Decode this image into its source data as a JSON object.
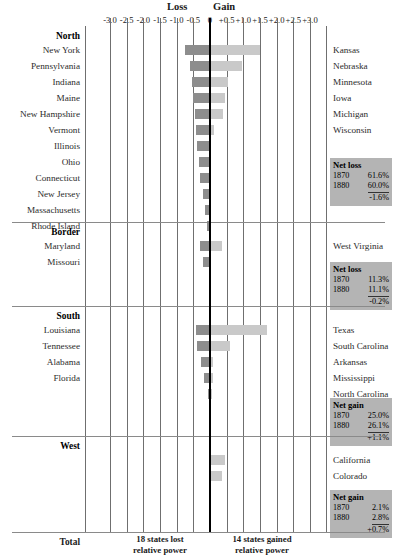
{
  "header": {
    "loss_label": "Loss",
    "gain_label": "Gain",
    "axis_ticks": [
      "-3.0",
      "-2.5",
      "-2.0",
      "-1.5",
      "-1.0",
      "-0.5",
      "0",
      "+0.5",
      "+1.0",
      "+1.5",
      "+2.0",
      "+2.5",
      "+3.0"
    ]
  },
  "total": {
    "label": "Total",
    "left_note": "18 states lost\nrelative power",
    "left_note_line1": "18 states lost",
    "left_note_line2": "relative power",
    "right_note_line1": "14 states gained",
    "right_note_line2": "relative power"
  },
  "colors": {
    "loss_bar": "#8d8d8d",
    "gain_bar": "#c9c9c9",
    "netbox_bg": "#b4b4b4",
    "zero_line": "#000000",
    "gridline": "#6f6f6f"
  },
  "chart_data": {
    "type": "bar",
    "title": "",
    "xlabel": "",
    "ylabel": "",
    "xlim": [
      -3.0,
      3.0
    ],
    "grid": true,
    "orientation": "horizontal-diverging",
    "legend_position": "top",
    "series": [
      {
        "name": "Loss",
        "color": "#8d8d8d"
      },
      {
        "name": "Gain",
        "color": "#c9c9c9"
      }
    ],
    "sections": [
      {
        "name": "North",
        "rows": [
          {
            "left": "New York",
            "right": "Kansas",
            "loss": -0.75,
            "gain": 1.5
          },
          {
            "left": "Pennsylvania",
            "right": "Nebraska",
            "loss": -0.6,
            "gain": 0.95
          },
          {
            "left": "Indiana",
            "right": "Minnesota",
            "loss": -0.55,
            "gain": 0.55
          },
          {
            "left": "Maine",
            "right": "Iowa",
            "loss": -0.5,
            "gain": 0.45
          },
          {
            "left": "New Hampshire",
            "right": "Michigan",
            "loss": -0.45,
            "gain": 0.4
          },
          {
            "left": "Vermont",
            "right": "Wisconsin",
            "loss": -0.42,
            "gain": 0.12
          },
          {
            "left": "Illinois",
            "right": "",
            "loss": -0.38,
            "gain": 0.0
          },
          {
            "left": "Ohio",
            "right": "",
            "loss": -0.34,
            "gain": 0.0
          },
          {
            "left": "Connecticut",
            "right": "",
            "loss": -0.3,
            "gain": 0.0
          },
          {
            "left": "New Jersey",
            "right": "",
            "loss": -0.22,
            "gain": 0.0
          },
          {
            "left": "Massachusetts",
            "right": "",
            "loss": -0.14,
            "gain": 0.0
          },
          {
            "left": "Rhode Island",
            "right": "",
            "loss": -0.1,
            "gain": 0.0
          }
        ],
        "net": {
          "title": "Net loss",
          "y1_label": "1870",
          "y1": "61.6%",
          "y2_label": "1880",
          "y2": "60.0%",
          "delta": "-1.6%"
        }
      },
      {
        "name": "Border",
        "rows": [
          {
            "left": "Maryland",
            "right": "West Virginia",
            "loss": -0.3,
            "gain": 0.36
          },
          {
            "left": "Missouri",
            "right": "",
            "loss": -0.22,
            "gain": 0.0
          }
        ],
        "net": {
          "title": "Net loss",
          "y1_label": "1870",
          "y1": "11.3%",
          "y2_label": "1880",
          "y2": "11.1%",
          "delta": "-0.2%"
        }
      },
      {
        "name": "South",
        "rows": [
          {
            "left": "Louisiana",
            "right": "Texas",
            "loss": -0.42,
            "gain": 1.7
          },
          {
            "left": "Tennessee",
            "right": "South Carolina",
            "loss": -0.4,
            "gain": 0.6
          },
          {
            "left": "Alabama",
            "right": "Arkansas",
            "loss": -0.26,
            "gain": 0.1
          },
          {
            "left": "Florida",
            "right": "Mississippi",
            "loss": -0.18,
            "gain": 0.08
          },
          {
            "left": "",
            "right": "North Carolina",
            "loss": -0.05,
            "gain": 0.05
          }
        ],
        "net": {
          "title": "Net gain",
          "y1_label": "1870",
          "y1": "25.0%",
          "y2_label": "1880",
          "y2": "26.1%",
          "delta": "+1.1%"
        }
      },
      {
        "name": "West",
        "rows": [
          {
            "left": "",
            "right": "California",
            "loss": 0.0,
            "gain": 0.45
          },
          {
            "left": "",
            "right": "Colorado",
            "loss": 0.0,
            "gain": 0.36
          }
        ],
        "net": {
          "title": "Net gain",
          "y1_label": "1870",
          "y1": "2.1%",
          "y2_label": "1880",
          "y2": "2.8%",
          "delta": "+0.7%"
        }
      }
    ]
  }
}
